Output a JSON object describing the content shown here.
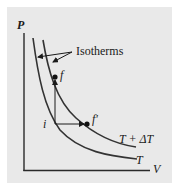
{
  "diagram": {
    "axes": {
      "y_label": "P",
      "x_label": "V"
    },
    "annotation": "Isotherms",
    "curves": [
      {
        "label": "T + ΔT",
        "role": "upper-isotherm"
      },
      {
        "label": "T",
        "role": "lower-isotherm"
      }
    ],
    "points": {
      "initial": "i",
      "final_vertical": "f",
      "final_horizontal": "f′"
    },
    "colors": {
      "background": "#e9e9e9",
      "ink": "#2a2a2a"
    }
  }
}
